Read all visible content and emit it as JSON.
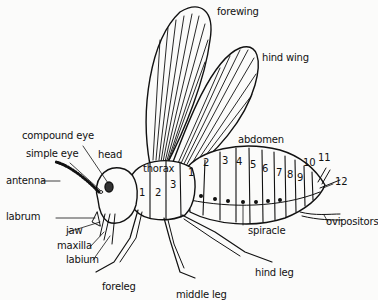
{
  "diagram": {
    "labels": {
      "forewing": "forewing",
      "hind_wing": "hind wing",
      "abdomen": "abdomen",
      "compound_eye": "compound eye",
      "simple_eye": "simple eye",
      "head": "head",
      "antenna": "antenna",
      "thorax": "thorax",
      "labrum": "labrum",
      "jaw": "jaw",
      "maxilla": "maxilla",
      "labium": "labium",
      "foreleg": "foreleg",
      "middle_leg": "middle leg",
      "hind_leg": "hind leg",
      "spiracle": "spiracle",
      "ovipositors": "ovipositors"
    },
    "thorax_segments": [
      "1",
      "2",
      "3"
    ],
    "abdomen_segments": [
      "1",
      "2",
      "3",
      "4",
      "5",
      "6",
      "7",
      "8",
      "9",
      "10",
      "11",
      "12"
    ],
    "colors": {
      "ink": "#111111",
      "background": "#fbfbfa"
    }
  }
}
